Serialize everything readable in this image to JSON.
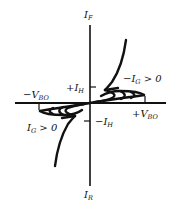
{
  "diagram": {
    "axes": {
      "y_positive": {
        "main": "I",
        "sub": "F"
      },
      "y_negative": {
        "main": "I",
        "sub": "R"
      }
    },
    "labels": {
      "plus_ih": {
        "main": "+I",
        "sub": "H"
      },
      "minus_ih": {
        "main": "−I",
        "sub": "H"
      },
      "minus_vbo": {
        "main": "−V",
        "sub": "BO"
      },
      "plus_vbo": {
        "main": "+V",
        "sub": "BO"
      },
      "gate_q1": {
        "main": "−I",
        "sub": "G",
        "rest": " > 0"
      },
      "gate_q3": {
        "main": "I",
        "sub": "G",
        "rest": " > 0"
      }
    },
    "colors": {
      "line": "#111111",
      "background": "#ffffff"
    }
  }
}
